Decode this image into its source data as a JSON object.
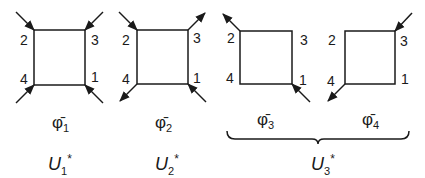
{
  "diagrams": [
    {
      "id": "phi1",
      "vertex_labels": {
        "tl": "2",
        "tr": "3",
        "bl": "4",
        "br": "1"
      },
      "legs": {
        "tl": "in",
        "tr": "in",
        "bl": "in",
        "br": "in"
      },
      "name": "φ̄",
      "sub": "1"
    },
    {
      "id": "phi2",
      "vertex_labels": {
        "tl": "2",
        "tr": "3",
        "bl": "4",
        "br": "1"
      },
      "legs": {
        "tl": "in",
        "tr": "out",
        "bl": "out",
        "br": "in"
      },
      "name": "φ̄",
      "sub": "2"
    },
    {
      "id": "phi3",
      "vertex_labels": {
        "tl": "2",
        "tr": "3",
        "bl": "4",
        "br": "1"
      },
      "legs": {
        "tl": "out",
        "br": "in"
      },
      "name": "φ̄",
      "sub": "3"
    },
    {
      "id": "phi4",
      "vertex_labels": {
        "tl": "2",
        "tr": "3",
        "bl": "4",
        "br": "1"
      },
      "legs": {
        "tr": "in",
        "bl": "out"
      },
      "name": "φ̄",
      "sub": "4"
    }
  ],
  "groups": [
    {
      "label": "U",
      "sub": "1",
      "sup": "*"
    },
    {
      "label": "U",
      "sub": "2",
      "sup": "*"
    },
    {
      "label": "U",
      "sub": "3",
      "sup": "*"
    }
  ]
}
